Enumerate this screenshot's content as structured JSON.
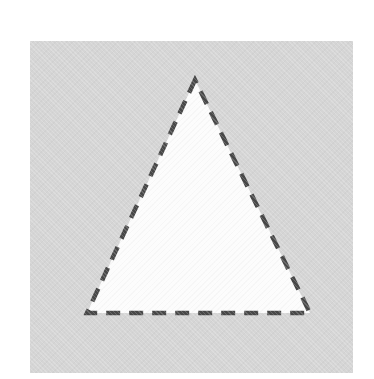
{
  "figure": {
    "square": {
      "fill": "#d5d5d5"
    },
    "triangle": {
      "points": "165,39 57,272 280,272",
      "fill": "#fcfcfc",
      "stroke": "#484848",
      "stroke_width": "4.5",
      "dash": "14 9"
    }
  }
}
